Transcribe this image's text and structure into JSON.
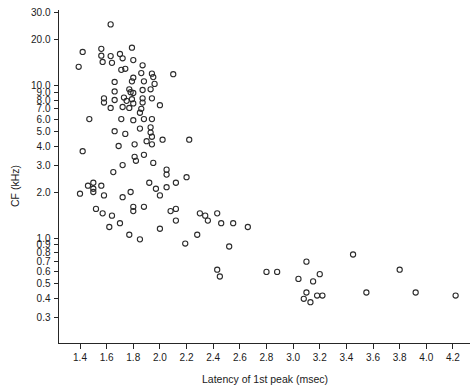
{
  "figure": {
    "background_color": "#ffffff",
    "marker_color": "#2b2b2b",
    "axis_color": "#262626"
  },
  "chart_data": {
    "type": "scatter",
    "title": "",
    "xlabel": "Latency of 1st peak (msec)",
    "ylabel": "CF (kHz)",
    "xscale": "linear",
    "yscale": "log",
    "xlim": [
      1.28,
      4.32
    ],
    "ylim": [
      0.26,
      33.0
    ],
    "grid": false,
    "legend": null,
    "xticks": [
      1.4,
      1.6,
      1.8,
      2.0,
      2.2,
      2.4,
      2.6,
      2.8,
      3.0,
      3.2,
      3.4,
      3.6,
      3.8,
      4.0,
      4.2
    ],
    "xticklabels": [
      "1.4",
      "1.6",
      "1.8",
      "2.0",
      "2.2",
      "2.4",
      "2.6",
      "2.8",
      "3.0",
      "3.2",
      "3.4",
      "3.6",
      "3.8",
      "4.0",
      "4.2"
    ],
    "yticks": [
      30.0,
      20.0,
      10.0,
      9.0,
      8.0,
      7.0,
      6.0,
      5.0,
      4.0,
      3.0,
      2.0,
      1.0,
      0.9,
      0.8,
      0.7,
      0.6,
      0.5,
      0.4,
      0.3
    ],
    "yticklabels": [
      "30.0",
      "20.0",
      "10.0",
      "9.0",
      "8.0",
      "7.0",
      "6.0",
      "5.0",
      "4.0",
      "3.0",
      "2.0",
      "1.0",
      "0.9",
      "0.8",
      "0.7",
      "0.6",
      "0.5",
      "0.4",
      "0.3"
    ],
    "marker": "o",
    "marker_filled": false,
    "n_points": 128,
    "series": [
      {
        "name": "CF vs latency",
        "points": [
          [
            1.63,
            25.0
          ],
          [
            1.42,
            16.5
          ],
          [
            1.56,
            17.3
          ],
          [
            1.56,
            15.6
          ],
          [
            1.57,
            14.2
          ],
          [
            1.63,
            15.5
          ],
          [
            1.64,
            14.0
          ],
          [
            1.79,
            17.6
          ],
          [
            1.8,
            14.6
          ],
          [
            1.87,
            13.5
          ],
          [
            1.39,
            13.2
          ],
          [
            1.71,
            12.6
          ],
          [
            2.1,
            11.8
          ],
          [
            1.66,
            10.5
          ],
          [
            1.79,
            10.6
          ],
          [
            1.8,
            11.2
          ],
          [
            1.95,
            11.3
          ],
          [
            1.94,
            11.9
          ],
          [
            1.88,
            10.6
          ],
          [
            1.77,
            9.4
          ],
          [
            1.78,
            9.0
          ],
          [
            1.8,
            8.9
          ],
          [
            1.87,
            9.3
          ],
          [
            1.93,
            9.4
          ],
          [
            1.58,
            8.2
          ],
          [
            1.58,
            7.7
          ],
          [
            1.66,
            8.0
          ],
          [
            1.73,
            8.3
          ],
          [
            1.75,
            7.9
          ],
          [
            1.79,
            8.1
          ],
          [
            1.8,
            7.6
          ],
          [
            1.87,
            8.2
          ],
          [
            1.87,
            7.7
          ],
          [
            1.94,
            8.2
          ],
          [
            1.63,
            7.1
          ],
          [
            1.72,
            7.2
          ],
          [
            1.77,
            7.1
          ],
          [
            1.86,
            7.0
          ],
          [
            2.0,
            7.4
          ],
          [
            1.47,
            6.0
          ],
          [
            1.71,
            6.0
          ],
          [
            1.8,
            5.9
          ],
          [
            1.88,
            6.0
          ],
          [
            1.94,
            6.0
          ],
          [
            1.66,
            5.0
          ],
          [
            1.74,
            4.8
          ],
          [
            1.85,
            5.2
          ],
          [
            1.93,
            5.3
          ],
          [
            1.93,
            4.9
          ],
          [
            1.94,
            4.6
          ],
          [
            1.42,
            3.7
          ],
          [
            1.69,
            4.0
          ],
          [
            1.81,
            4.1
          ],
          [
            1.94,
            4.1
          ],
          [
            2.02,
            4.4
          ],
          [
            2.22,
            4.4
          ],
          [
            1.81,
            3.4
          ],
          [
            1.82,
            3.2
          ],
          [
            1.88,
            3.5
          ],
          [
            1.95,
            3.1
          ],
          [
            1.65,
            2.7
          ],
          [
            2.05,
            2.8
          ],
          [
            2.05,
            2.6
          ],
          [
            2.2,
            2.5
          ],
          [
            1.46,
            2.2
          ],
          [
            1.5,
            2.3
          ],
          [
            1.5,
            2.1
          ],
          [
            1.5,
            2.0
          ],
          [
            1.56,
            2.2
          ],
          [
            1.78,
            2.0
          ],
          [
            1.58,
            1.9
          ],
          [
            1.72,
            1.85
          ],
          [
            1.8,
            1.6
          ],
          [
            1.8,
            1.5
          ],
          [
            1.88,
            1.6
          ],
          [
            1.57,
            1.45
          ],
          [
            1.64,
            1.4
          ],
          [
            2.08,
            1.5
          ],
          [
            2.12,
            1.3
          ],
          [
            2.3,
            1.45
          ],
          [
            2.34,
            1.4
          ],
          [
            2.36,
            1.3
          ],
          [
            2.43,
            1.45
          ],
          [
            2.46,
            1.25
          ],
          [
            2.55,
            1.25
          ],
          [
            2.0,
            1.15
          ],
          [
            2.28,
            1.05
          ],
          [
            1.77,
            1.05
          ],
          [
            1.85,
            0.98
          ],
          [
            2.19,
            0.92
          ],
          [
            2.52,
            0.88
          ],
          [
            2.43,
            0.62
          ],
          [
            2.45,
            0.56
          ],
          [
            2.8,
            0.6
          ],
          [
            2.88,
            0.6
          ],
          [
            3.1,
            0.7
          ],
          [
            3.04,
            0.54
          ],
          [
            3.15,
            0.52
          ],
          [
            3.2,
            0.58
          ],
          [
            3.45,
            0.78
          ],
          [
            3.8,
            0.62
          ],
          [
            3.1,
            0.44
          ],
          [
            3.18,
            0.42
          ],
          [
            3.22,
            0.42
          ],
          [
            3.08,
            0.4
          ],
          [
            3.13,
            0.38
          ],
          [
            3.55,
            0.44
          ],
          [
            3.92,
            0.44
          ],
          [
            4.22,
            0.42
          ],
          [
            2.66,
            1.18
          ],
          [
            2.12,
            1.55
          ],
          [
            1.97,
            2.1
          ],
          [
            2.05,
            2.15
          ],
          [
            1.72,
            3.0
          ],
          [
            1.4,
            1.95
          ],
          [
            1.52,
            1.55
          ],
          [
            1.92,
            2.3
          ],
          [
            2.0,
            1.9
          ],
          [
            1.7,
            1.25
          ],
          [
            1.62,
            1.18
          ],
          [
            1.86,
            12.0
          ],
          [
            1.7,
            16.0
          ],
          [
            1.72,
            15.0
          ],
          [
            1.74,
            12.8
          ],
          [
            1.96,
            10.2
          ],
          [
            1.85,
            6.6
          ],
          [
            1.66,
            9.1
          ],
          [
            1.9,
            4.3
          ],
          [
            2.12,
            2.3
          ]
        ]
      }
    ]
  }
}
